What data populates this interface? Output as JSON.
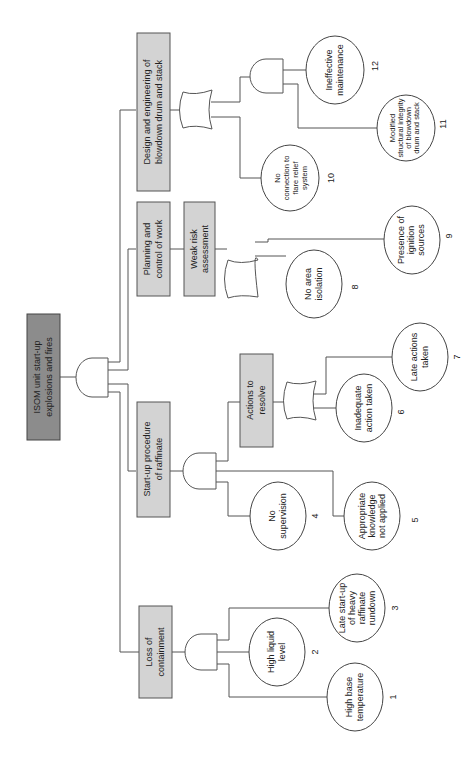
{
  "diagram": {
    "type": "fault-tree",
    "orientation": "rotated-90-ccw",
    "top_event": {
      "label_line1": "ISOM unit start-up",
      "label_line2": "explosions and fires",
      "gate": "AND"
    },
    "intermediate_events": [
      {
        "id": "loss",
        "line1": "Loss of",
        "line2": "containment",
        "gate": "AND"
      },
      {
        "id": "startup",
        "line1": "Start-up procedure",
        "line2": "of raffinate",
        "gate": "AND"
      },
      {
        "id": "actions",
        "line1": "Actions to",
        "line2": "resolve",
        "gate": "OR"
      },
      {
        "id": "planning",
        "line1": "Planning and",
        "line2": "control of work",
        "gate": "none"
      },
      {
        "id": "weak",
        "line1": "Weak risk",
        "line2": "assessment",
        "gate": "OR"
      },
      {
        "id": "design",
        "line1": "Design and engineering of",
        "line2": "blowdown drum and stack",
        "gate": "OR"
      },
      {
        "id": "design_and",
        "gate": "AND"
      }
    ],
    "basic_events": [
      {
        "num": "1",
        "lines": [
          "High base",
          "temperature"
        ]
      },
      {
        "num": "2",
        "lines": [
          "High liquid",
          "level"
        ]
      },
      {
        "num": "3",
        "lines": [
          "Late start-up",
          "of heavy",
          "raffinate",
          "rundown"
        ]
      },
      {
        "num": "4",
        "lines": [
          "No",
          "supervision"
        ]
      },
      {
        "num": "5",
        "lines": [
          "Appropriate",
          "knowledge",
          "not applied"
        ]
      },
      {
        "num": "6",
        "lines": [
          "Inadequate",
          "action taken"
        ]
      },
      {
        "num": "7",
        "lines": [
          "Late actions",
          "taken"
        ]
      },
      {
        "num": "8",
        "lines": [
          "No area",
          "isolation"
        ]
      },
      {
        "num": "9",
        "lines": [
          "Presence of",
          "ignition",
          "sources"
        ]
      },
      {
        "num": "10",
        "lines": [
          "No",
          "connection to",
          "flare relief",
          "system"
        ]
      },
      {
        "num": "11",
        "lines": [
          "Modified",
          "structural integrity",
          "of blowdown",
          "drum and stack"
        ]
      },
      {
        "num": "12",
        "lines": [
          "Ineffective",
          "maintenance"
        ]
      }
    ],
    "colors": {
      "top_fill": "#8c8c8c",
      "box_fill": "#d3d3d3",
      "line": "#555555"
    }
  }
}
